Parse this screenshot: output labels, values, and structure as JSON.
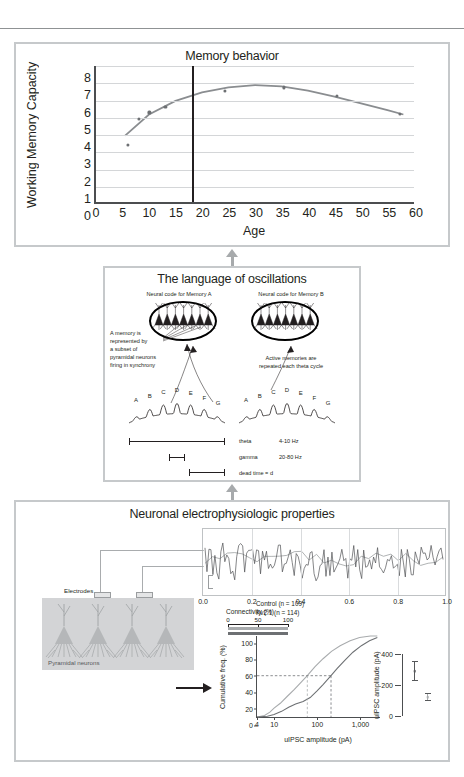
{
  "behavior_panel": {
    "title": "Memory behavior",
    "chart_data": {
      "type": "scatter",
      "title": "Memory behavior",
      "xlabel": "Age",
      "ylabel": "Working Memory Capacity",
      "xlim": [
        0,
        60
      ],
      "ylim": [
        0,
        8
      ],
      "xticks": [
        0,
        5,
        10,
        15,
        20,
        25,
        30,
        35,
        40,
        45,
        50,
        55,
        60
      ],
      "yticks": [
        0,
        1,
        2,
        3,
        4,
        5,
        6,
        7,
        8
      ],
      "grid": "horizontal",
      "legend": "none",
      "point_color": "#6d7073",
      "curve_color": "#8a8d90",
      "vertical_marker_x": 18,
      "vertical_marker_color": "#231f20",
      "points": [
        {
          "x": 6,
          "y": 3.4
        },
        {
          "x": 8,
          "y": 4.9
        },
        {
          "x": 10,
          "y": 5.3
        },
        {
          "x": 13,
          "y": 5.6
        },
        {
          "x": 24.2,
          "y": 6.55
        },
        {
          "x": 35.2,
          "y": 6.75
        },
        {
          "x": 45.1,
          "y": 6.25
        },
        {
          "x": 57,
          "y": 5.2
        }
      ],
      "fit_curve": [
        {
          "x": 5.5,
          "y": 3.9
        },
        {
          "x": 10,
          "y": 5.15
        },
        {
          "x": 15,
          "y": 5.95
        },
        {
          "x": 20,
          "y": 6.45
        },
        {
          "x": 25,
          "y": 6.75
        },
        {
          "x": 30,
          "y": 6.88
        },
        {
          "x": 35,
          "y": 6.8
        },
        {
          "x": 40,
          "y": 6.55
        },
        {
          "x": 45,
          "y": 6.2
        },
        {
          "x": 50,
          "y": 5.8
        },
        {
          "x": 55,
          "y": 5.4
        },
        {
          "x": 58,
          "y": 5.15
        }
      ]
    }
  },
  "oscillations_panel": {
    "title": "The language of oscillations",
    "code_a_label": "Neural code for Memory A",
    "code_b_label": "Neural code for Memory B",
    "annotation_left": "A memory is\nrepresented by\na subset of\npyramidal neurons\nfiring in synchrony",
    "annotation_right": "Active memories are\nrepeated each theta cycle",
    "gamma_letters": [
      "A",
      "B",
      "C",
      "D",
      "E",
      "F",
      "G"
    ],
    "frequencies": [
      {
        "band": "theta",
        "range": "4-10 Hz"
      },
      {
        "band": "gamma",
        "range": "20-80 Hz"
      }
    ],
    "dead_time_label": "dead time = d"
  },
  "ephys_panel": {
    "title": "Neuronal electrophysiologic properties",
    "electrodes_label": "Electrodes",
    "pyramidal_label": "Pyramidal neurons",
    "trace_chart": {
      "type": "line",
      "title": "",
      "xlabel": "",
      "ylabel": "",
      "xlim": [
        0.0,
        1.0
      ],
      "xticks": [
        "0.0",
        "0.2",
        "0.4",
        "0.6",
        "0.8",
        "1.0"
      ],
      "grid": "vertical",
      "series": [
        {
          "name": "fast-trace",
          "color": "#4c4e50"
        },
        {
          "name": "slow-trace",
          "color": "#9a9d9f"
        }
      ]
    },
    "cumulative_chart": {
      "type": "line",
      "title": "",
      "xlabel": "uIPSC amplitude (pA)",
      "ylabel": "Cumulative freq. (%)",
      "xscale": "log",
      "xlim": [
        4,
        3000
      ],
      "ylim": [
        0,
        100
      ],
      "yticks": [
        0,
        20,
        40,
        60,
        80,
        100
      ],
      "xticks": [
        "4",
        "10",
        "100",
        "1,000"
      ],
      "grid": "off",
      "legend_position": "top-left",
      "median_guide_y": 51,
      "series": [
        {
          "name": "Control (n = 109)",
          "label": "Control (n = 109)",
          "color": "#a8abad",
          "median_x": 60,
          "points": [
            {
              "x": 4,
              "y": 0
            },
            {
              "x": 6,
              "y": 2
            },
            {
              "x": 8,
              "y": 6
            },
            {
              "x": 10,
              "y": 11
            },
            {
              "x": 14,
              "y": 17
            },
            {
              "x": 20,
              "y": 25
            },
            {
              "x": 30,
              "y": 34
            },
            {
              "x": 45,
              "y": 44
            },
            {
              "x": 60,
              "y": 51
            },
            {
              "x": 90,
              "y": 62
            },
            {
              "x": 140,
              "y": 72
            },
            {
              "x": 220,
              "y": 81
            },
            {
              "x": 350,
              "y": 88
            },
            {
              "x": 600,
              "y": 94
            },
            {
              "x": 1000,
              "y": 98
            },
            {
              "x": 1800,
              "y": 100
            },
            {
              "x": 2600,
              "y": 100
            }
          ]
        },
        {
          "name": "Kv2.1 (n = 114)",
          "label": "Kv2.1 (n = 114)",
          "color": "#6d7073",
          "median_x": 215,
          "points": [
            {
              "x": 4,
              "y": 0
            },
            {
              "x": 7,
              "y": 1
            },
            {
              "x": 10,
              "y": 3
            },
            {
              "x": 15,
              "y": 7
            },
            {
              "x": 22,
              "y": 12
            },
            {
              "x": 32,
              "y": 16
            },
            {
              "x": 48,
              "y": 19
            },
            {
              "x": 70,
              "y": 24
            },
            {
              "x": 100,
              "y": 32
            },
            {
              "x": 140,
              "y": 40
            },
            {
              "x": 215,
              "y": 51
            },
            {
              "x": 300,
              "y": 60
            },
            {
              "x": 450,
              "y": 70
            },
            {
              "x": 700,
              "y": 80
            },
            {
              "x": 1100,
              "y": 88
            },
            {
              "x": 1700,
              "y": 94
            },
            {
              "x": 2600,
              "y": 98
            }
          ]
        }
      ]
    },
    "connectivity_inset": {
      "type": "bar",
      "title": "Connectivity (%)",
      "xticks": [
        "0",
        "50",
        "100"
      ],
      "xlim": [
        0,
        100
      ],
      "bars": [
        {
          "name": "Control",
          "value": 100,
          "color": "#a8abad"
        },
        {
          "name": "Kv2.1",
          "value": 100,
          "color": "#6d7073"
        }
      ]
    },
    "amplitude_inset": {
      "type": "scatter",
      "ylabel": "uIPSC amplitude (pA)",
      "ylim": [
        0,
        400
      ],
      "yticks": [
        0,
        200,
        400
      ],
      "groups": [
        {
          "name": "Control",
          "mean": 290,
          "err_low": 225,
          "err_high": 355,
          "color": "#56585a"
        },
        {
          "name": "Kv2.1",
          "mean": 120,
          "err_low": 95,
          "err_high": 150,
          "color": "#a8abad"
        }
      ]
    }
  }
}
